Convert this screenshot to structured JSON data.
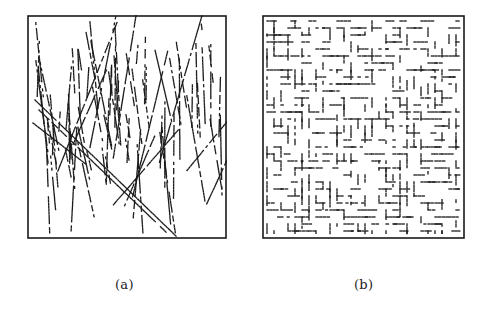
{
  "figure": {
    "panels": [
      {
        "id": "a",
        "caption": "(a)",
        "description": "Edge/line map with predominantly vertical and diagonal dashed strokes; two crossing diagonal lines in lower-left region",
        "frame": {
          "x": 27,
          "y": 15,
          "width": 200,
          "height": 224
        },
        "stroke_color": "#1a1a1a",
        "pattern": "oriented-lines",
        "seed": 7
      },
      {
        "id": "b",
        "caption": "(b)",
        "description": "Maze-like map of short horizontal and vertical dashed segments",
        "frame": {
          "x": 262,
          "y": 15,
          "width": 203,
          "height": 224
        },
        "stroke_color": "#1a1a1a",
        "pattern": "maze",
        "seed": 13
      }
    ]
  }
}
